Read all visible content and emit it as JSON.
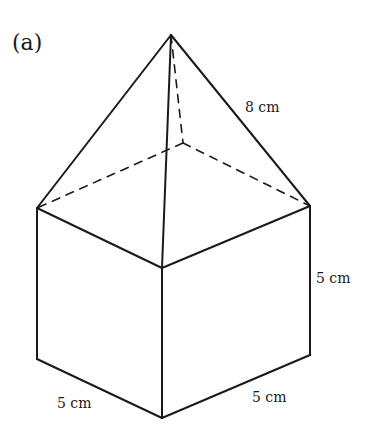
{
  "figure": {
    "part_label": "(a)",
    "shape": "square-based pyramid on top of a cube",
    "stroke_color": "#1a1a1a",
    "background": "#ffffff"
  },
  "dimensions": {
    "slant_edge": "8 cm",
    "cube_height": "5 cm",
    "cube_front_left_edge": "5 cm",
    "cube_front_right_edge": "5 cm"
  },
  "vertices": {
    "apex": [
      171,
      35
    ],
    "top_left": [
      37,
      208
    ],
    "top_front": [
      162,
      268
    ],
    "top_right": [
      310,
      206
    ],
    "top_back": [
      183,
      143
    ],
    "bottom_left": [
      37,
      359
    ],
    "bottom_front": [
      162,
      418
    ],
    "bottom_right": [
      310,
      355
    ]
  }
}
